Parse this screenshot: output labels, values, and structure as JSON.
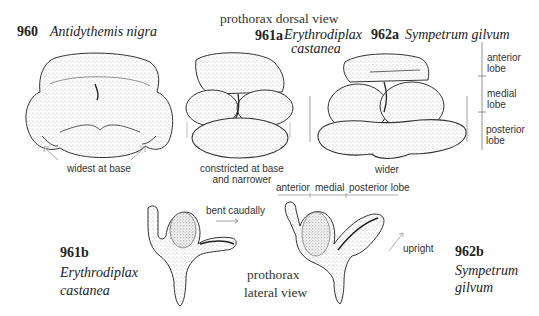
{
  "figure": {
    "title_dorsal": "prothorax   dorsal view",
    "title_lateral_line1": "prothorax",
    "title_lateral_line2": "lateral view"
  },
  "specimens": [
    {
      "id": "960",
      "species": "Antidythemis nigra",
      "view": "dorsal",
      "note": "widest at base"
    },
    {
      "id": "961a",
      "species_line1": "Erythrodiplax",
      "species_line2": "castanea",
      "view": "dorsal",
      "note_line1": "constricted at base",
      "note_line2": "and narrower"
    },
    {
      "id": "962a",
      "species": "Sympetrum gilvum",
      "view": "dorsal",
      "note": "wider"
    },
    {
      "id": "961b",
      "species_line1": "Erythrodiplax",
      "species_line2": "castanea",
      "view": "lateral",
      "note": "bent caudally"
    },
    {
      "id": "962b",
      "species_line1": "Sympetrum",
      "species_line2": "gilvum",
      "view": "lateral",
      "note": "upright"
    }
  ],
  "lobe_labels_vertical": [
    {
      "line1": "anterior",
      "line2": "lobe"
    },
    {
      "line1": "medial",
      "line2": "lobe"
    },
    {
      "line1": "posterior",
      "line2": "lobe"
    }
  ],
  "lobe_labels_horizontal": [
    "anterior",
    "medial",
    "posterior lobe"
  ],
  "colors": {
    "ink": "#222222",
    "stipple": "#555555",
    "arrow": "#999999",
    "background": "#ffffff"
  }
}
